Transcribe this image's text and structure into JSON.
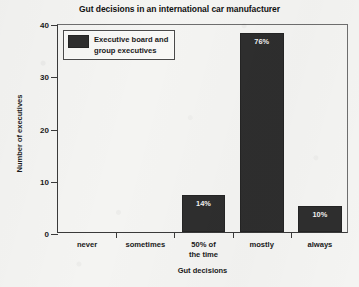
{
  "chart_data": {
    "type": "bar",
    "title": "Gut decisions in an international car manufacturer",
    "xlabel": "Gut decisions",
    "ylabel": "Number of executives",
    "categories": [
      "never",
      "sometimes",
      "50% of\nthe time",
      "mostly",
      "always"
    ],
    "values": [
      0,
      0,
      7,
      38,
      5
    ],
    "point_labels": [
      "",
      "",
      "14%",
      "76%",
      "10%"
    ],
    "series": [
      {
        "name": "Executive board and\ngroup executives",
        "values": [
          0,
          0,
          7,
          38,
          5
        ],
        "color": "#2e2e2e"
      }
    ],
    "ylim": [
      0,
      40
    ],
    "yticks": [
      0,
      10,
      20,
      30,
      40
    ],
    "ytick_labels": [
      "0",
      "10",
      "20",
      "30",
      "40"
    ],
    "grid": false,
    "legend_position": "upper-left-inside",
    "bar_color": "#2e2e2e",
    "background_color": "#f4f4f2"
  },
  "legend": {
    "label": "Executive board and\ngroup executives",
    "swatch_name": "legend-color-swatch"
  }
}
